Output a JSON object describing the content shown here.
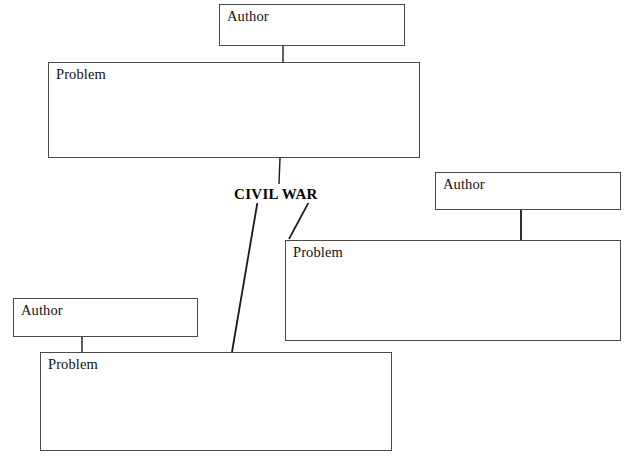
{
  "diagram": {
    "center_topic": {
      "label": "CIVIL WAR",
      "x": 232,
      "y": 186
    },
    "page_background": "#ffffff",
    "box_border_color": "#4a4a4a",
    "connector_color": "#1a1a1a",
    "nodes": [
      {
        "id": "author-top",
        "name": "author-box-top",
        "label": "Author",
        "body": "",
        "x": 219,
        "y": 4,
        "width": 186,
        "height": 42
      },
      {
        "id": "problem-top",
        "name": "problem-box-top",
        "label": "Problem",
        "body": "",
        "x": 48,
        "y": 62,
        "width": 372,
        "height": 96
      },
      {
        "id": "author-right",
        "name": "author-box-right",
        "label": "Author",
        "body": "",
        "x": 435,
        "y": 172,
        "width": 186,
        "height": 38
      },
      {
        "id": "problem-right",
        "name": "problem-box-right",
        "label": "Problem",
        "body": "",
        "x": 285,
        "y": 240,
        "width": 336,
        "height": 101
      },
      {
        "id": "author-bottom-left",
        "name": "author-box-bottom-left",
        "label": "Author",
        "body": "",
        "x": 13,
        "y": 298,
        "width": 185,
        "height": 39
      },
      {
        "id": "problem-bottom",
        "name": "problem-box-bottom",
        "label": "Problem",
        "body": "",
        "x": 40,
        "y": 352,
        "width": 352,
        "height": 99
      }
    ],
    "connectors": [
      {
        "id": "author-top-to-problem-top",
        "name": "connector-author-top-to-problem-top",
        "x1": 283,
        "y1": 46,
        "x2": 283,
        "y2": 62,
        "width": 1.4
      },
      {
        "id": "problem-top-to-center",
        "name": "connector-problem-top-to-center",
        "x1": 280,
        "y1": 158,
        "x2": 279,
        "y2": 184,
        "width": 1.4
      },
      {
        "id": "author-right-to-problem-right",
        "name": "connector-author-right-to-problem-right",
        "x1": 521,
        "y1": 210,
        "x2": 521,
        "y2": 241,
        "width": 1.8
      },
      {
        "id": "center-to-problem-right",
        "name": "connector-center-to-problem-right",
        "x1": 311,
        "y1": 198,
        "x2": 289,
        "y2": 239,
        "width": 1.6
      },
      {
        "id": "center-to-problem-bottom",
        "name": "connector-center-to-problem-bottom",
        "x1": 258,
        "y1": 199,
        "x2": 232,
        "y2": 352,
        "width": 1.8
      },
      {
        "id": "author-bottom-left-to-problem-bottom",
        "name": "connector-author-bottom-left-to-problem-bottom",
        "x1": 82,
        "y1": 337,
        "x2": 82,
        "y2": 353,
        "width": 1.4
      }
    ]
  }
}
